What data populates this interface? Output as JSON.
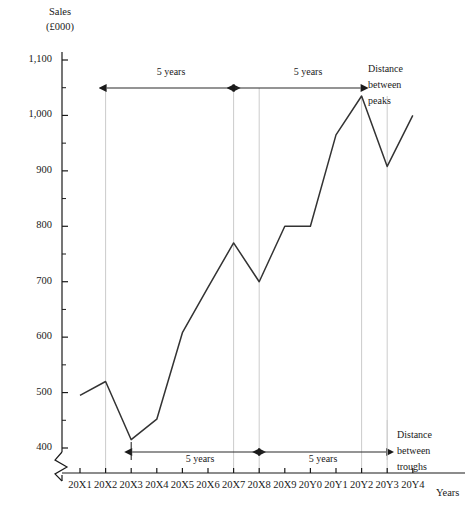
{
  "chart_data": {
    "type": "line",
    "title": "",
    "ylabel": "Sales (£000)",
    "ylabel_line1": "Sales",
    "ylabel_line2": "(£000)",
    "xlabel": "Years",
    "ylim": [
      400,
      1100
    ],
    "ytick_step": 100,
    "yminor_step": 50,
    "y_axis_break": true,
    "grid": false,
    "legend": "none",
    "categories": [
      "20X1",
      "20X2",
      "20X3",
      "20X4",
      "20X5",
      "20X6",
      "20X7",
      "20X8",
      "20X9",
      "20Y0",
      "20Y1",
      "20Y2",
      "20Y3",
      "20Y4"
    ],
    "ytick_labels": [
      "400",
      "500",
      "600",
      "700",
      "800",
      "900",
      "1,000",
      "1,100"
    ],
    "ytick_values": [
      400,
      500,
      600,
      700,
      800,
      900,
      1000,
      1100
    ],
    "series": [
      {
        "name": "Sales",
        "color": "#333333",
        "values": [
          495,
          520,
          415,
          452,
          608,
          690,
          770,
          700,
          800,
          800,
          965,
          1035,
          908,
          1000
        ]
      }
    ],
    "peaks": [
      "20X2",
      "20X7",
      "20Y2"
    ],
    "troughs": [
      "20X3",
      "20X8",
      "20Y3"
    ],
    "annotations": [
      {
        "name": "peaks-span-1",
        "label": "5 years",
        "from": "20X2",
        "to": "20X7",
        "position": "top"
      },
      {
        "name": "peaks-span-2",
        "label": "5 years",
        "from": "20X7",
        "to": "20Y2",
        "position": "top"
      },
      {
        "name": "troughs-span-1",
        "label": "5 years",
        "from": "20X3",
        "to": "20X8",
        "position": "bottom"
      },
      {
        "name": "troughs-span-2",
        "label": "5 years",
        "from": "20X8",
        "to": "20Y3",
        "position": "bottom"
      },
      {
        "name": "peaks-note",
        "label": "Distance between peaks",
        "line1": "Distance",
        "line2": "between",
        "line3": "peaks"
      },
      {
        "name": "troughs-note",
        "label": "Distance between troughs",
        "line1": "Distance",
        "line2": "between",
        "line3": "troughs"
      }
    ],
    "guide_lines": [
      "20X2",
      "20X7",
      "20X8",
      "20Y2",
      "20Y3"
    ],
    "colors": {
      "line": "#333333",
      "axis": "#1a1a1a",
      "guide": "#cccccc",
      "annotation": "#2a2a2a",
      "background": "#ffffff"
    }
  }
}
